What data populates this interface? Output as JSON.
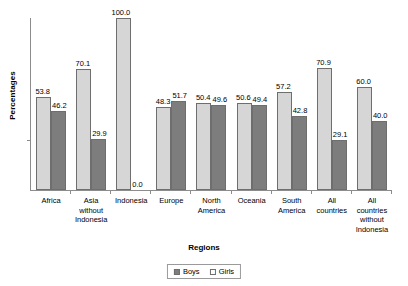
{
  "chart_data": {
    "type": "bar",
    "title": "",
    "subtitle": "",
    "xlabel": "Regions",
    "ylabel": "Percentages",
    "ylim": [
      0,
      100
    ],
    "grid": false,
    "legend_position": "bottom",
    "categories": [
      "Africa",
      "Asia without Indonesia",
      "Indonesia",
      "Europe",
      "North America",
      "Oceania",
      "South America",
      "All countries",
      "All countries without Indonesia"
    ],
    "category_lines": [
      [
        "Africa"
      ],
      [
        "Asia",
        "without",
        "Indonesia"
      ],
      [
        "Indonesia"
      ],
      [
        "Europe"
      ],
      [
        "North",
        "America"
      ],
      [
        "Oceania"
      ],
      [
        "South",
        "America"
      ],
      [
        "All",
        "countries"
      ],
      [
        "All",
        "countries",
        "without",
        "Indonesia"
      ]
    ],
    "series": [
      {
        "name": "Boys",
        "color": "#d6d6d6",
        "values": [
          53.8,
          70.1,
          100.0,
          48.3,
          50.4,
          50.6,
          57.2,
          70.9,
          60.0
        ],
        "labels": [
          "53.8",
          "70.1",
          "100.0",
          "48.3",
          "50.4",
          "50.6",
          "57.2",
          "70.9",
          "60.0"
        ]
      },
      {
        "name": "Girls",
        "color": "#7d7d7d",
        "values": [
          46.2,
          29.9,
          0.0,
          51.7,
          49.6,
          49.4,
          42.8,
          29.1,
          40.0
        ],
        "labels": [
          "46.2",
          "29.9",
          "0.0",
          "51.7",
          "49.6",
          "49.4",
          "42.8",
          "29.1",
          "40.0"
        ]
      }
    ],
    "ytick_labels": []
  },
  "axes": {
    "y_title": "Percentages",
    "x_title": "Regions"
  },
  "legend": {
    "items": [
      {
        "label": "Boys",
        "swatch": "filled-dark"
      },
      {
        "label": "Girls",
        "swatch": "outline-light"
      }
    ]
  },
  "colors": {
    "boys_bar": "#d6d6d6",
    "girls_bar": "#7d7d7d",
    "bar_border": "#6e6e6e",
    "axis": "#8c8c8c",
    "text": "#000000",
    "background": "#ffffff"
  }
}
